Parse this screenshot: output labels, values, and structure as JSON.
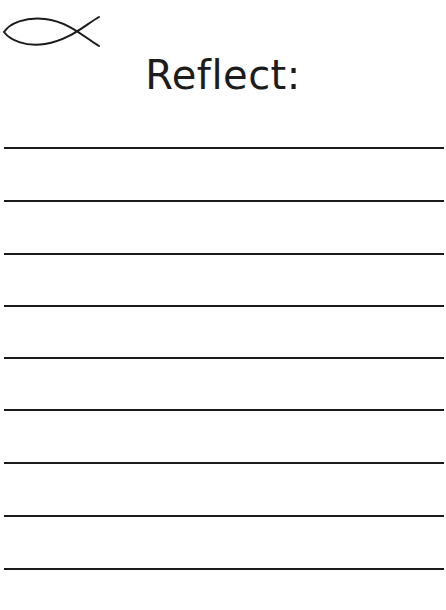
{
  "header": {
    "cut_text": "",
    "icon": "ichthys-fish-icon"
  },
  "title": "Reflect:",
  "writing_lines": {
    "count": 9,
    "positions_y": [
      148,
      201,
      254,
      306,
      358,
      410,
      463,
      516,
      569
    ],
    "color": "#1a1a1a"
  }
}
